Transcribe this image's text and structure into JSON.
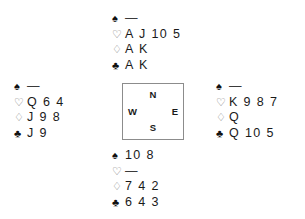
{
  "diagram": {
    "type": "bridge-hand-deal",
    "void_marker": "—",
    "suit_symbols": {
      "spades": "♠",
      "hearts": "♡",
      "diamonds": "♢",
      "clubs": "♣"
    },
    "compass": {
      "north": "N",
      "south": "S",
      "west": "W",
      "east": "E"
    },
    "hands": {
      "north": {
        "label": "North",
        "spades": "—",
        "hearts": "A J 10 5",
        "diamonds": "A K",
        "clubs": "A K"
      },
      "west": {
        "label": "West",
        "spades": "—",
        "hearts": "Q 6 4",
        "diamonds": "J 9 8",
        "clubs": "J 9"
      },
      "east": {
        "label": "East",
        "spades": "—",
        "hearts": "K 9 8 7",
        "diamonds": "Q",
        "clubs": "Q 10 5"
      },
      "south": {
        "label": "South",
        "spades": "10 8",
        "hearts": "—",
        "diamonds": "7 4 2",
        "clubs": "6 4 3"
      }
    },
    "colors": {
      "background": "#ffffff",
      "text": "#1a1a1a",
      "outline_suit": "#7a7a7a",
      "box_border": "#8c8c8c"
    }
  }
}
